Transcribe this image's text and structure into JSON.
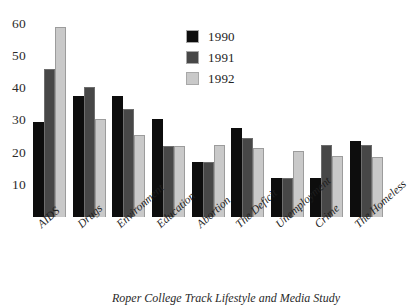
{
  "chart_data": {
    "type": "bar",
    "title": "",
    "subtitle": "",
    "xlabel": "",
    "ylabel": "",
    "ylim": [
      0,
      63
    ],
    "yticks": [
      10,
      20,
      30,
      40,
      50,
      60
    ],
    "grid": false,
    "legend_position": "top-right",
    "categories": [
      "AIDS",
      "Drugs",
      "Environment",
      "Education",
      "Abortion",
      "The Deficit",
      "Unemployment",
      "Crime",
      "The Homeless"
    ],
    "series": [
      {
        "name": "1990",
        "color": "#0d0d0d",
        "values": [
          29.5,
          37.5,
          37.5,
          30.5,
          17,
          27.5,
          12,
          12,
          23.5
        ]
      },
      {
        "name": "1991",
        "color": "#474747",
        "values": [
          46,
          40.5,
          33.5,
          22,
          17,
          24.5,
          12,
          22.5,
          22.5
        ]
      },
      {
        "name": "1992",
        "color": "#c9c9c9",
        "values": [
          59,
          30.5,
          25.5,
          22,
          22.5,
          21.5,
          20.5,
          19,
          18.5
        ]
      }
    ]
  },
  "caption": "Roper College Track Lifestyle and Media Study"
}
